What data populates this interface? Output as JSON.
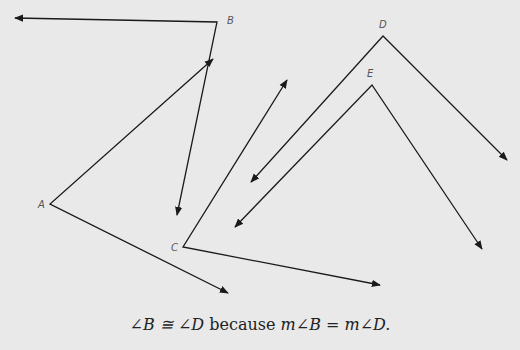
{
  "figure": {
    "angles": [
      {
        "vertex": "A",
        "vertex_xy": [
          50,
          204
        ],
        "ray_ends": [
          [
            213,
            59
          ],
          [
            228,
            293
          ]
        ]
      },
      {
        "vertex": "B",
        "vertex_xy": [
          217,
          22
        ],
        "ray_ends": [
          [
            15,
            18
          ],
          [
            177,
            215
          ]
        ]
      },
      {
        "vertex": "C",
        "vertex_xy": [
          183,
          247
        ],
        "ray_ends": [
          [
            287,
            80
          ],
          [
            380,
            285
          ]
        ]
      },
      {
        "vertex": "D",
        "vertex_xy": [
          383,
          36
        ],
        "ray_ends": [
          [
            251,
            182
          ],
          [
            507,
            160
          ]
        ]
      },
      {
        "vertex": "E",
        "vertex_xy": [
          372,
          85
        ],
        "ray_ends": [
          [
            235,
            227
          ],
          [
            482,
            249
          ]
        ]
      }
    ],
    "labels": {
      "A": "A",
      "B": "B",
      "C": "C",
      "D": "D",
      "E": "E"
    },
    "line_color": "#1a1a1a",
    "background": "#e9e9e9"
  },
  "caption": {
    "part1": "∠B ≅ ∠D",
    "part2": " because ",
    "part3": "m∠B = m∠D."
  }
}
